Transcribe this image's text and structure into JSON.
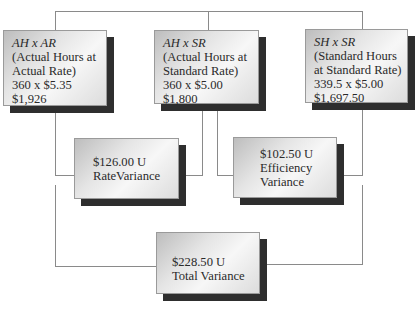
{
  "diagram": {
    "top_boxes": [
      {
        "formula": "AH x AR",
        "line1": "(Actual Hours at",
        "line2": "Actual Rate)",
        "calc": "360 x $5.35",
        "result": "$1,926"
      },
      {
        "formula": "AH x SR",
        "line1": "(Actual Hours at",
        "line2": "Standard Rate)",
        "calc": "360 x $5.00",
        "result": "$1,800"
      },
      {
        "formula": "SH x SR",
        "line1": "(Standard Hours",
        "line2": "at Standard Rate)",
        "calc": "339.5 x $5.00",
        "result": "$1,697.50"
      }
    ],
    "variances": [
      {
        "amount": "$126.00 U",
        "label1": "RateVariance",
        "label2": ""
      },
      {
        "amount": "$102.50 U",
        "label1": "Efficiency",
        "label2": "Variance"
      }
    ],
    "total": {
      "amount": "$228.50 U",
      "label": "Total Variance"
    },
    "colors": {
      "shadow": "#2e2e2e",
      "line": "#8a8a8a",
      "box_border": "#9a9a9a"
    }
  }
}
